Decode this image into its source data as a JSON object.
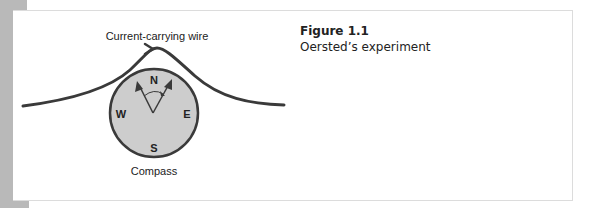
{
  "figure": {
    "number": "Figure 1.1",
    "title": "Oersted’s experiment"
  },
  "diagram": {
    "wire_label": "Current-carrying wire",
    "compass_label": "Compass",
    "directions": {
      "north": "N",
      "south": "S",
      "east": "E",
      "west": "W"
    }
  },
  "colors": {
    "side_bar": "#b9b9b9",
    "compass_fill": "#cdcdcd",
    "stroke": "#3a3a3a",
    "frame_border": "#dcdcdc"
  }
}
